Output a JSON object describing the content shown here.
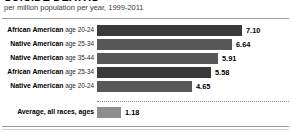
{
  "title": "SUICIDE DEATHS",
  "subtitle": "per million population per year, 1999-2011",
  "chart_data": {
    "type": "bar",
    "title": "SUICIDE DEATHS",
    "subtitle": "per million population per year, 1999-2011",
    "xlabel": "",
    "ylabel": "",
    "orientation": "horizontal",
    "grid": false,
    "legend": null,
    "xlim": [
      0,
      7.4
    ],
    "categories": [
      "African American age 20-24",
      "Native American age 25-34",
      "Native American age 35-44",
      "African American age 25-34",
      "Native American age 20-24",
      "Average, all races, ages"
    ],
    "values": [
      7.1,
      6.64,
      5.91,
      5.58,
      4.65,
      1.18
    ],
    "value_labels": [
      "7.10",
      "6.64",
      "5.91",
      "5.58",
      "4.65",
      "1.18"
    ],
    "annotations": [
      "dotted separator above the Average row"
    ]
  },
  "rows": [
    {
      "group": "African American",
      "age": "age 20-24",
      "value": "7.10",
      "num": 7.1,
      "shade": "dark"
    },
    {
      "group": "Native American",
      "age": "age 25-34",
      "value": "6.64",
      "num": 6.64,
      "shade": "mid"
    },
    {
      "group": "Native American",
      "age": "age 35-44",
      "value": "5.91",
      "num": 5.91,
      "shade": "mid"
    },
    {
      "group": "African American",
      "age": "age 25-34",
      "value": "5.58",
      "num": 5.58,
      "shade": "dark"
    },
    {
      "group": "Native American",
      "age": "age 20-24",
      "value": "4.65",
      "num": 4.65,
      "shade": "mid"
    }
  ],
  "average_row": {
    "label": "Average, all races, ages",
    "value": "1.18",
    "num": 1.18,
    "shade": "light"
  },
  "colors": {
    "bar_dark": "#3a3a3a",
    "bar_mid": "#585858",
    "bar_light": "#8e8e8e",
    "rule": "#9a9a9a",
    "text": "#000000"
  }
}
